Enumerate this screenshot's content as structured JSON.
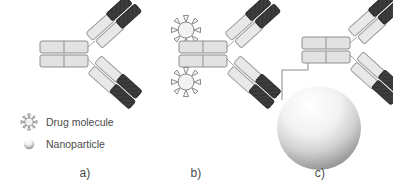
{
  "figure": {
    "panels": [
      {
        "id": "a",
        "label": "a)",
        "name": "bare-antibody",
        "description": "Antibody alone"
      },
      {
        "id": "b",
        "label": "b)",
        "name": "antibody-drug-conjugate",
        "description": "Antibody conjugated with drug molecules",
        "drug_count": 2
      },
      {
        "id": "c",
        "label": "c)",
        "name": "antibody-nanoparticle-conjugate",
        "description": "Antibody conjugated to a nanoparticle via linker",
        "nanoparticle_count": 1
      }
    ]
  },
  "legend": {
    "items": [
      {
        "icon": "drug-molecule-icon",
        "label": "Drug molecule"
      },
      {
        "icon": "nanoparticle-icon",
        "label": "Nanoparticle"
      }
    ]
  },
  "colors": {
    "background": "#ffffff",
    "light_segment_fill": "#e8e8e8",
    "light_segment_stroke": "#9a9a9a",
    "dark_segment_fill": "#3d3d3d",
    "dark_segment_stroke": "#2a2a2a",
    "fc_fill": "#e2e2e2",
    "fc_stroke": "#8f8f8f",
    "linker_stroke": "#b4b4b4",
    "drug_fill": "#f2f2f2",
    "drug_stroke": "#8a8a8a",
    "nanoparticle_light": "#ffffff",
    "nanoparticle_dark": "#9b9b9b",
    "text": "#4a4a4a"
  }
}
